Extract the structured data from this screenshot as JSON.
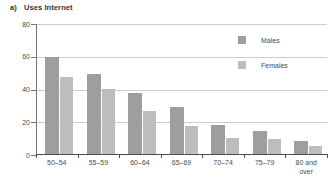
{
  "title": {
    "prefix": "a)",
    "text": "Uses Internet"
  },
  "colors": {
    "bar_males": "#9e9e9e",
    "bar_females": "#bdbdbd",
    "gridline": "#cccccc",
    "axis": "#4d4d4d",
    "text": "#4d4d4d",
    "background": "#ffffff"
  },
  "chart_data": {
    "type": "bar",
    "categories": [
      "50–54",
      "55–59",
      "60–64",
      "65–69",
      "70–74",
      "75–79",
      "80 and over"
    ],
    "series": [
      {
        "name": "Males",
        "color": "#9e9e9e",
        "values": [
          59,
          49,
          37,
          29,
          18,
          14,
          8
        ]
      },
      {
        "name": "Females",
        "color": "#bdbdbd",
        "values": [
          47,
          40,
          26,
          17,
          10,
          9,
          5
        ]
      }
    ],
    "xlabel": "",
    "ylabel": "",
    "ylim": [
      0,
      80
    ],
    "y_ticks": [
      0,
      20,
      40,
      60,
      80
    ],
    "grid": true,
    "legend_position": "upper right"
  }
}
